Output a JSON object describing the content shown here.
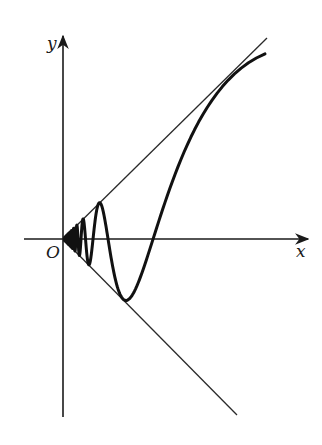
{
  "figure": {
    "width": 322,
    "height": 445,
    "origin": {
      "x": 63,
      "y": 239
    },
    "x_axis": {
      "x_start": 24,
      "x_end": 308,
      "label": "x",
      "label_pos": {
        "x": 296,
        "y": 257
      }
    },
    "y_axis": {
      "y_start": 417,
      "y_end": 36,
      "label": "y",
      "label_pos": {
        "x": 47,
        "y": 49
      }
    },
    "origin_label": {
      "text": "O",
      "pos": {
        "x": 46,
        "y": 258
      }
    },
    "upper_bound_line": {
      "x1": 63,
      "y1": 239,
      "x2": 267,
      "y2": 38,
      "equation": "y = x"
    },
    "lower_bound_line": {
      "x1": 63,
      "y1": 239,
      "x2": 237,
      "y2": 415,
      "equation": "y = -x"
    },
    "curve": {
      "equation": "y = x sin(k/x)",
      "k": 283,
      "x_min_px": 1.5,
      "x_max_px": 202,
      "samples": 3000,
      "end_damp": 0.93
    },
    "colors": {
      "ink": "#111111",
      "background": "#ffffff"
    }
  }
}
